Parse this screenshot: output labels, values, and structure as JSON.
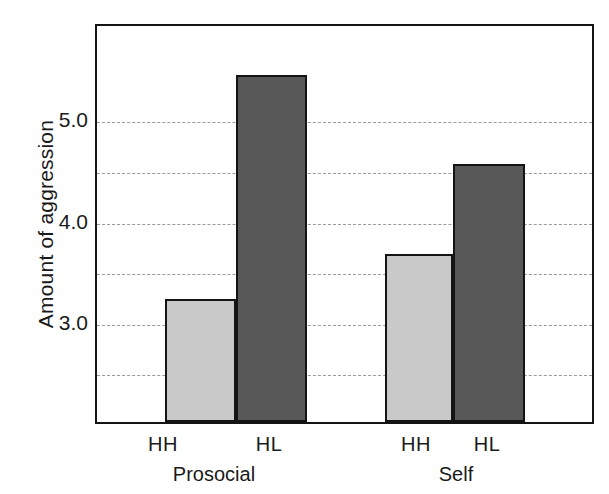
{
  "chart_data": {
    "type": "bar",
    "title": "",
    "xlabel": "",
    "ylabel": "Amount of aggression",
    "ylim": [
      2.0,
      5.95
    ],
    "grid": true,
    "grid_values": [
      5.0,
      4.5,
      4.0,
      3.5,
      3.0,
      2.5
    ],
    "ytick_labels": [
      "5.0",
      "4.0",
      "3.0"
    ],
    "ytick_values": [
      5.0,
      4.0,
      3.0
    ],
    "legend": "none",
    "groups": [
      "Prosocial",
      "Self"
    ],
    "categories": [
      "HH",
      "HL"
    ],
    "series": [
      {
        "name": "HH",
        "color": "#c9c9c9",
        "values": [
          3.22,
          3.66
        ]
      },
      {
        "name": "HL",
        "color": "#585858",
        "values": [
          5.43,
          4.55
        ]
      }
    ],
    "bars": [
      {
        "group": "Prosocial",
        "category": "HH",
        "value": 3.22,
        "fill": "#c9c9c9"
      },
      {
        "group": "Prosocial",
        "category": "HL",
        "value": 5.43,
        "fill": "#585858"
      },
      {
        "group": "Self",
        "category": "HH",
        "value": 3.66,
        "fill": "#c9c9c9"
      },
      {
        "group": "Self",
        "category": "HL",
        "value": 4.55,
        "fill": "#585858"
      }
    ],
    "colors": {
      "light_bar": "#c9c9c9",
      "dark_bar": "#585858",
      "axis": "#141414",
      "grid": "#9a9a9a",
      "background": "#ffffff"
    }
  },
  "axis": {
    "y_title": "Amount of aggression",
    "y_ticks": [
      "5.0",
      "4.0",
      "3.0"
    ]
  },
  "x_labels": {
    "prosocial_hh": "HH",
    "prosocial_hl": "HL",
    "self_hh": "HH",
    "self_hl": "HL"
  },
  "group_labels": {
    "left": "Prosocial",
    "right": "Self"
  }
}
